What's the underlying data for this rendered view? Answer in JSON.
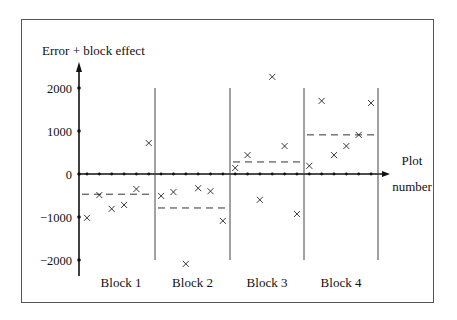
{
  "chart_data": {
    "type": "scatter",
    "title": "",
    "ylabel": "Error + block effect",
    "xlabel": "Plot number",
    "xlabel_lines": [
      "Plot",
      "number"
    ],
    "ylim": [
      -2400,
      2400
    ],
    "yticks": [
      2000,
      1000,
      0,
      -1000,
      -2000
    ],
    "ytick_labels": [
      "2000",
      "1000",
      "0",
      "−1000",
      "−2000"
    ],
    "grid": false,
    "legend": null,
    "marker": "x",
    "blocks": [
      {
        "name": "Block 1",
        "plots": [
          1,
          2,
          3,
          4,
          5,
          6
        ],
        "values": [
          -1020,
          -490,
          -810,
          -720,
          -350,
          720
        ],
        "mean": -470
      },
      {
        "name": "Block 2",
        "plots": [
          7,
          8,
          9,
          10,
          11,
          12
        ],
        "values": [
          -510,
          -420,
          -2090,
          -330,
          -400,
          -1090
        ],
        "mean": -790
      },
      {
        "name": "Block 3",
        "plots": [
          13,
          14,
          15,
          16,
          17,
          18
        ],
        "values": [
          140,
          440,
          -600,
          2260,
          650,
          -930
        ],
        "mean": 280
      },
      {
        "name": "Block 4",
        "plots": [
          19,
          20,
          21,
          22,
          23,
          24
        ],
        "values": [
          190,
          1700,
          440,
          650,
          910,
          1650
        ],
        "mean": 910
      }
    ],
    "annotations": [
      "Dashed horizontal lines show block means",
      "Vertical lines separate blocks"
    ]
  }
}
